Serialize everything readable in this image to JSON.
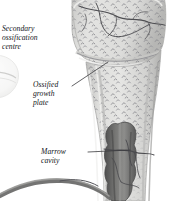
{
  "figure": {
    "background_color": "#ffffff",
    "bone_color": "#d8d8d6",
    "bone_shadow_color": "#a9a9a7",
    "marrow_color": "#6a6a6a",
    "trabecula_color": "#8c8c8f",
    "vessel_color": "#5c5c60",
    "label_color": "#14161a",
    "leader_color": "#3a3a3e"
  },
  "labels": [
    {
      "id": "secondary-ossification-centre",
      "text": "Secondary\nossification\ncentre",
      "leader": false
    },
    {
      "id": "ossified-growth-plate",
      "text": "Ossified\ngrowth\nplate",
      "leader": true
    },
    {
      "id": "marrow-cavity",
      "text": "Marrow\ncavity",
      "leader": true
    }
  ],
  "structures": [
    {
      "id": "epiphysis",
      "name": "epiphysis"
    },
    {
      "id": "articular-cartilage-rim",
      "name": "articular cartilage rim"
    },
    {
      "id": "growth-plate-line",
      "name": "ossified growth plate line"
    },
    {
      "id": "metaphysis",
      "name": "metaphysis"
    },
    {
      "id": "diaphysis-shaft",
      "name": "diaphysis shaft"
    },
    {
      "id": "marrow-cavity-region",
      "name": "marrow cavity"
    },
    {
      "id": "nutrient-vessel",
      "name": "nutrient blood vessel"
    },
    {
      "id": "secondary-centre-fragment",
      "name": "secondary ossification centre fragment"
    }
  ]
}
